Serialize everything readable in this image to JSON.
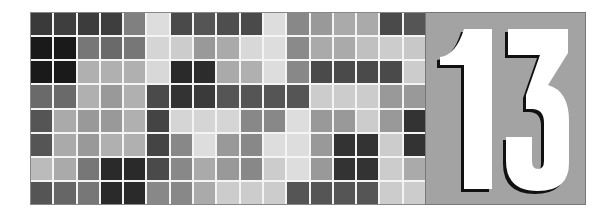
{
  "graphic": {
    "number": "13",
    "panel_color": "#a3a3a3",
    "digit_color": "#ffffff",
    "shadow_color": "#111111"
  },
  "grid": {
    "rows": 8,
    "columns": 17,
    "cells": [
      [
        "#3a3a3a",
        "#3e3e3e",
        "#3c3c3c",
        "#3e3e3e",
        "#808080",
        "#dddddd",
        "#4a4a4a",
        "#555555",
        "#4e4e4e",
        "#4a4a4a",
        "#dddddd",
        "#888888",
        "#999999",
        "#aaaaaa",
        "#aaaaaa",
        "#4a4a4a",
        "#555555"
      ],
      [
        "#1a1a1a",
        "#1a1a1a",
        "#777777",
        "#6a6a6a",
        "#777777",
        "#d5d5d5",
        "#cccccc",
        "#999999",
        "#aaaaaa",
        "#d8d8d8",
        "#dddddd",
        "#8a8a8a",
        "#aaaaaa",
        "#aaaaaa",
        "#c0c0c0",
        "#cccccc",
        "#c8c8c8"
      ],
      [
        "#1a1a1a",
        "#1a1a1a",
        "#b0b0b0",
        "#b0b0b0",
        "#b0b0b0",
        "#d8d8d8",
        "#2a2a2a",
        "#2c2c2c",
        "#aaaaaa",
        "#b0b0b0",
        "#dddddd",
        "#888888",
        "#4a4a4a",
        "#4a4a4a",
        "#4a4a4a",
        "#4a4a4a",
        "#cccccc"
      ],
      [
        "#6a6a6a",
        "#6a6a6a",
        "#b0b0b0",
        "#999999",
        "#b0b0b0",
        "#4a4a4a",
        "#333333",
        "#3a3a3a",
        "#555555",
        "#555555",
        "#555555",
        "#555555",
        "#cccccc",
        "#cccccc",
        "#cccccc",
        "#999999",
        "#999999"
      ],
      [
        "#555555",
        "#aaaaaa",
        "#999999",
        "#999999",
        "#b0b0b0",
        "#444444",
        "#d5d5d5",
        "#d5d5d5",
        "#d5d5d5",
        "#888888",
        "#888888",
        "#dddddd",
        "#999999",
        "#999999",
        "#cccccc",
        "#999999",
        "#333333"
      ],
      [
        "#555555",
        "#aaaaaa",
        "#999999",
        "#b0b0b0",
        "#b0b0b0",
        "#444444",
        "#888888",
        "#dddddd",
        "#999999",
        "#888888",
        "#dddddd",
        "#dddddd",
        "#999999",
        "#333333",
        "#333333",
        "#cccccc",
        "#333333"
      ],
      [
        "#bbbbbb",
        "#aaaaaa",
        "#777777",
        "#2a2a2a",
        "#2a2a2a",
        "#4a4a4a",
        "#888888",
        "#aaaaaa",
        "#999999",
        "#888888",
        "#cccccc",
        "#dddddd",
        "#999999",
        "#333333",
        "#333333",
        "#cccccc",
        "#aaaaaa"
      ],
      [
        "#555555",
        "#666666",
        "#777777",
        "#2a2a2a",
        "#2a2a2a",
        "#888888",
        "#888888",
        "#aaaaaa",
        "#cccccc",
        "#cccccc",
        "#cccccc",
        "#555555",
        "#555555",
        "#555555",
        "#555555",
        "#cccccc",
        "#cccccc"
      ]
    ]
  }
}
